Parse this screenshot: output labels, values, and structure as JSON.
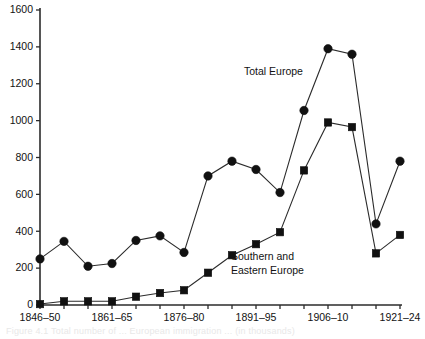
{
  "chart_data": {
    "type": "line",
    "title": "",
    "xlabel": "",
    "ylabel": "",
    "ylim": [
      0,
      1600
    ],
    "ytick_values": [
      0,
      200,
      400,
      600,
      800,
      1000,
      1200,
      1400,
      1600
    ],
    "ytick_labels": [
      "0",
      "200",
      "400",
      "600",
      "800",
      "1000",
      "1200",
      "1400",
      "1600"
    ],
    "grid": false,
    "legend_position": "inline-annotation",
    "categories": [
      "1846–50",
      "1851–55",
      "1856–60",
      "1861–65",
      "1866–70",
      "1871–75",
      "1876–80",
      "1881–85",
      "1886–90",
      "1891–95",
      "1896–1900",
      "1901–05",
      "1906–10",
      "1911–15",
      "1916–20",
      "1921–24"
    ],
    "xtick_labels_shown": [
      "1846–50",
      "",
      "",
      "1861–65",
      "",
      "",
      "1876–80",
      "",
      "",
      "1891–95",
      "",
      "",
      "1906–10",
      "",
      "",
      "1921–24"
    ],
    "series": [
      {
        "name": "Total Europe",
        "marker": "circle",
        "values": [
          250,
          345,
          210,
          225,
          350,
          375,
          285,
          700,
          780,
          735,
          610,
          1055,
          1390,
          1360,
          440,
          780
        ]
      },
      {
        "name": "Southern and Eastern Europe",
        "marker": "square",
        "values": [
          5,
          20,
          20,
          20,
          45,
          65,
          80,
          175,
          270,
          330,
          395,
          730,
          990,
          965,
          280,
          380
        ]
      }
    ],
    "annotations": [
      {
        "id": "total-europe-label",
        "text": "Total Europe"
      },
      {
        "id": "southern-eastern-label-line1",
        "text": "Southern and"
      },
      {
        "id": "southern-eastern-label-line2",
        "text": "Eastern Europe"
      }
    ]
  },
  "caption": {
    "text": "Figure 4.1  Total number of ... European immigration ... (in thousands)"
  },
  "colors": {
    "ink": "#2b2b2b",
    "marker": "#111111",
    "background": "#ffffff"
  }
}
